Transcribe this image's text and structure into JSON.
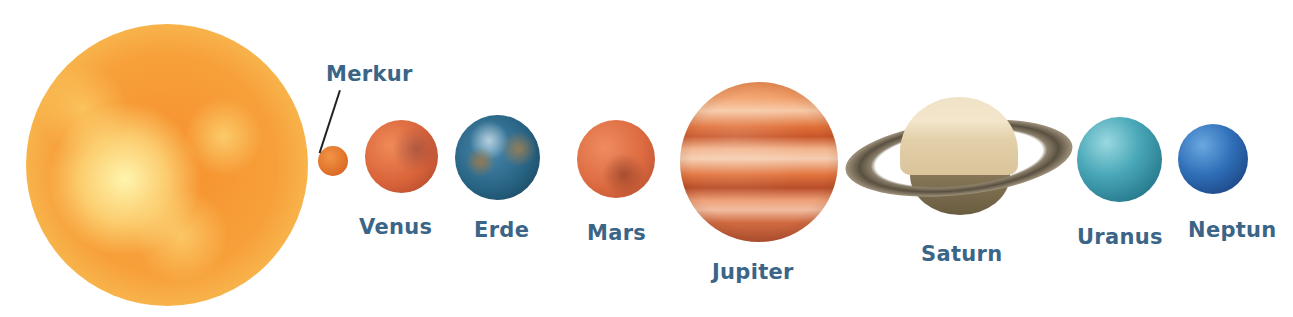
{
  "diagram": {
    "type": "solar-system",
    "bodies": [
      {
        "id": "sun",
        "label": "",
        "color": "#f6902e"
      },
      {
        "id": "mercury",
        "label": "Merkur",
        "color": "#e0722a"
      },
      {
        "id": "venus",
        "label": "Venus",
        "color": "#d9643a"
      },
      {
        "id": "earth",
        "label": "Erde",
        "color": "#25607f"
      },
      {
        "id": "mars",
        "label": "Mars",
        "color": "#dc6a40"
      },
      {
        "id": "jupiter",
        "label": "Jupiter",
        "color": "#e07038"
      },
      {
        "id": "saturn",
        "label": "Saturn",
        "color": "#e3cfa8"
      },
      {
        "id": "uranus",
        "label": "Uranus",
        "color": "#4aa8b8"
      },
      {
        "id": "neptune",
        "label": "Neptun",
        "color": "#2f6fb8"
      }
    ],
    "label_color": "#3b6587"
  }
}
